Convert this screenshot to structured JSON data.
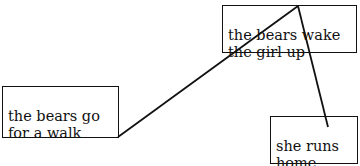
{
  "nodes": [
    {
      "id": "walk",
      "label": "the bears go\nfor a walk"
    },
    {
      "id": "wake",
      "label": "the bears wake\nthe girl up"
    },
    {
      "id": "runs",
      "label": "she runs\nhome"
    }
  ],
  "edges": [
    {
      "from": "walk",
      "to": "wake"
    },
    {
      "from": "wake",
      "to": "runs"
    }
  ]
}
